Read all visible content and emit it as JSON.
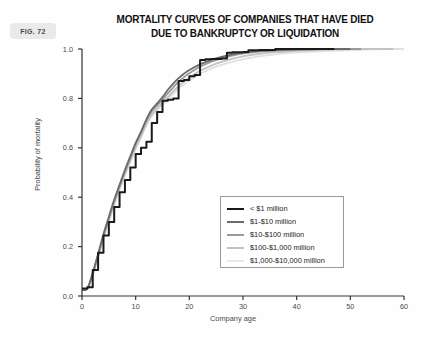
{
  "figure": {
    "badge_label": "FIG. 72"
  },
  "chart_data": {
    "type": "line",
    "title": "MORTALITY CURVES OF COMPANIES THAT HAVE DIED DUE TO BANKRUPTCY OR LIQUIDATION",
    "title_lines": [
      "MORTALITY CURVES OF COMPANIES THAT HAVE DIED",
      "DUE TO BANKRUPTCY OR LIQUIDATION"
    ],
    "xlabel": "Company age",
    "ylabel": "Probability of mortality",
    "xlim": [
      0,
      60
    ],
    "ylim": [
      0.0,
      1.0
    ],
    "xticks": [
      0,
      10,
      20,
      30,
      40,
      50,
      60
    ],
    "xtick_labels": [
      "0",
      "10",
      "20",
      "30",
      "40",
      "50",
      "60"
    ],
    "yticks": [
      0.0,
      0.2,
      0.4,
      0.6,
      0.8,
      1.0
    ],
    "ytick_labels": [
      "0.0",
      "0.2",
      "0.4",
      "0.6",
      "0.8",
      "1.0"
    ],
    "grid": false,
    "legend_position": "center-right",
    "series": [
      {
        "name": "< $1 million",
        "color": "#1a1a1a",
        "linewidth": 2.0,
        "style": "step",
        "points": [
          [
            0,
            0.03
          ],
          [
            1,
            0.035
          ],
          [
            2,
            0.105
          ],
          [
            3,
            0.175
          ],
          [
            4,
            0.245
          ],
          [
            5,
            0.3
          ],
          [
            6,
            0.36
          ],
          [
            7,
            0.42
          ],
          [
            8,
            0.47
          ],
          [
            9,
            0.52
          ],
          [
            10,
            0.575
          ],
          [
            11,
            0.6
          ],
          [
            12,
            0.625
          ],
          [
            13,
            0.7
          ],
          [
            14,
            0.745
          ],
          [
            15,
            0.79
          ],
          [
            16,
            0.795
          ],
          [
            17,
            0.8
          ],
          [
            18,
            0.87
          ],
          [
            19,
            0.875
          ],
          [
            20,
            0.89
          ],
          [
            21,
            0.895
          ],
          [
            22,
            0.955
          ],
          [
            23,
            0.958
          ],
          [
            24,
            0.96
          ],
          [
            26,
            0.962
          ],
          [
            27,
            0.985
          ],
          [
            28,
            0.987
          ],
          [
            30,
            0.988
          ],
          [
            31,
            0.995
          ],
          [
            33,
            0.996
          ],
          [
            36,
            1.0
          ],
          [
            47,
            1.0
          ]
        ]
      },
      {
        "name": "$1-$10 million",
        "color": "#6b6b6b",
        "linewidth": 1.8,
        "style": "smooth",
        "points": [
          [
            0,
            0.025
          ],
          [
            1,
            0.03
          ],
          [
            2,
            0.095
          ],
          [
            3,
            0.17
          ],
          [
            4,
            0.25
          ],
          [
            5,
            0.32
          ],
          [
            6,
            0.39
          ],
          [
            7,
            0.45
          ],
          [
            8,
            0.51
          ],
          [
            9,
            0.565
          ],
          [
            10,
            0.62
          ],
          [
            11,
            0.665
          ],
          [
            12,
            0.715
          ],
          [
            13,
            0.755
          ],
          [
            14,
            0.78
          ],
          [
            15,
            0.805
          ],
          [
            16,
            0.835
          ],
          [
            17,
            0.86
          ],
          [
            18,
            0.882
          ],
          [
            19,
            0.9
          ],
          [
            20,
            0.915
          ],
          [
            22,
            0.938
          ],
          [
            24,
            0.955
          ],
          [
            26,
            0.968
          ],
          [
            28,
            0.978
          ],
          [
            30,
            0.985
          ],
          [
            33,
            0.992
          ],
          [
            36,
            0.996
          ],
          [
            40,
            0.999
          ],
          [
            44,
            1.0
          ],
          [
            50,
            1.0
          ]
        ]
      },
      {
        "name": "$10-$100 million",
        "color": "#9a9a9a",
        "linewidth": 1.8,
        "style": "smooth",
        "points": [
          [
            0,
            0.025
          ],
          [
            1,
            0.03
          ],
          [
            2,
            0.09
          ],
          [
            3,
            0.165
          ],
          [
            4,
            0.245
          ],
          [
            5,
            0.315
          ],
          [
            6,
            0.385
          ],
          [
            7,
            0.445
          ],
          [
            8,
            0.505
          ],
          [
            9,
            0.56
          ],
          [
            10,
            0.615
          ],
          [
            11,
            0.66
          ],
          [
            12,
            0.71
          ],
          [
            13,
            0.748
          ],
          [
            14,
            0.772
          ],
          [
            15,
            0.795
          ],
          [
            16,
            0.82
          ],
          [
            17,
            0.845
          ],
          [
            18,
            0.868
          ],
          [
            19,
            0.886
          ],
          [
            20,
            0.902
          ],
          [
            22,
            0.928
          ],
          [
            24,
            0.948
          ],
          [
            26,
            0.962
          ],
          [
            28,
            0.973
          ],
          [
            30,
            0.981
          ],
          [
            33,
            0.989
          ],
          [
            36,
            0.994
          ],
          [
            40,
            0.998
          ],
          [
            45,
            1.0
          ],
          [
            52,
            1.0
          ]
        ]
      },
      {
        "name": "$100-$1,000 million",
        "color": "#c2c2c2",
        "linewidth": 1.8,
        "style": "smooth",
        "points": [
          [
            0,
            0.025
          ],
          [
            1,
            0.03
          ],
          [
            2,
            0.088
          ],
          [
            3,
            0.16
          ],
          [
            4,
            0.238
          ],
          [
            5,
            0.308
          ],
          [
            6,
            0.375
          ],
          [
            7,
            0.436
          ],
          [
            8,
            0.495
          ],
          [
            9,
            0.548
          ],
          [
            10,
            0.602
          ],
          [
            11,
            0.648
          ],
          [
            12,
            0.698
          ],
          [
            13,
            0.735
          ],
          [
            14,
            0.76
          ],
          [
            15,
            0.782
          ],
          [
            16,
            0.805
          ],
          [
            17,
            0.828
          ],
          [
            18,
            0.85
          ],
          [
            19,
            0.868
          ],
          [
            20,
            0.884
          ],
          [
            22,
            0.912
          ],
          [
            24,
            0.932
          ],
          [
            26,
            0.948
          ],
          [
            28,
            0.96
          ],
          [
            30,
            0.97
          ],
          [
            33,
            0.98
          ],
          [
            36,
            0.987
          ],
          [
            40,
            0.993
          ],
          [
            45,
            0.998
          ],
          [
            52,
            1.0
          ],
          [
            58,
            1.0
          ]
        ]
      },
      {
        "name": "$1,000-$10,000 million",
        "color": "#e0e0e0",
        "linewidth": 1.8,
        "style": "smooth",
        "points": [
          [
            0,
            0.025
          ],
          [
            1,
            0.03
          ],
          [
            2,
            0.086
          ],
          [
            3,
            0.156
          ],
          [
            4,
            0.232
          ],
          [
            5,
            0.3
          ],
          [
            6,
            0.366
          ],
          [
            7,
            0.428
          ],
          [
            8,
            0.486
          ],
          [
            9,
            0.54
          ],
          [
            10,
            0.594
          ],
          [
            11,
            0.64
          ],
          [
            12,
            0.69
          ],
          [
            13,
            0.728
          ],
          [
            14,
            0.752
          ],
          [
            15,
            0.774
          ],
          [
            16,
            0.796
          ],
          [
            17,
            0.818
          ],
          [
            18,
            0.84
          ],
          [
            19,
            0.856
          ],
          [
            20,
            0.872
          ],
          [
            22,
            0.9
          ],
          [
            24,
            0.92
          ],
          [
            26,
            0.936
          ],
          [
            28,
            0.948
          ],
          [
            30,
            0.958
          ],
          [
            33,
            0.97
          ],
          [
            36,
            0.978
          ],
          [
            40,
            0.986
          ],
          [
            45,
            0.992
          ],
          [
            50,
            0.996
          ],
          [
            55,
            0.999
          ],
          [
            60,
            1.0
          ]
        ]
      }
    ]
  },
  "legend": {
    "items": [
      {
        "label": "< $1 million",
        "color": "#1a1a1a",
        "width": "2.6px"
      },
      {
        "label": "$1-$10 million",
        "color": "#6b6b6b",
        "width": "2.2px"
      },
      {
        "label": "$10-$100 million",
        "color": "#9a9a9a",
        "width": "2.2px"
      },
      {
        "label": "$100-$1,000 million",
        "color": "#c2c2c2",
        "width": "2.2px"
      },
      {
        "label": "$1,000-$10,000 million",
        "color": "#e8e8e8",
        "width": "2.2px"
      }
    ]
  },
  "axis_color": "#333333",
  "text_color": "#4a4a4a"
}
